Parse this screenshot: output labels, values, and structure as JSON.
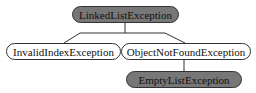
{
  "diagram": {
    "type": "class-hierarchy",
    "nodes": [
      {
        "id": "root",
        "label": "LinkedListException",
        "style": "dark"
      },
      {
        "id": "invalid",
        "label": "InvalidIndexException",
        "style": "light",
        "parent": "root"
      },
      {
        "id": "notfound",
        "label": "ObjectNotFoundException",
        "style": "light",
        "parent": "root"
      },
      {
        "id": "empty",
        "label": "EmptyListException",
        "style": "dark",
        "parent": "notfound"
      }
    ],
    "colors": {
      "dark_fill": "#777777",
      "light_fill": "#ffffff",
      "border": "#333333"
    }
  }
}
